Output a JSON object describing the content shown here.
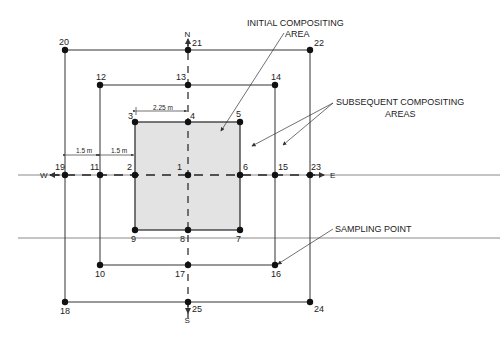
{
  "figure": {
    "colors": {
      "line": "#333333",
      "ground_line": "#888888",
      "initial_area_fill": "#e3e3e3",
      "point": "#111111",
      "text": "#222222"
    }
  },
  "compass": {
    "north": "N",
    "south": "S",
    "east": "E",
    "west": "W"
  },
  "dimensions": {
    "half_width_initial": "2.25 m",
    "spacing_outer": "1.5 m",
    "spacing_inner": "1.5 m"
  },
  "callouts": {
    "initial_line1": "INITIAL COMPOSITING",
    "initial_line2": "AREA",
    "subsequent_line1": "SUBSEQUENT COMPOSITING",
    "subsequent_line2": "AREAS",
    "sampling_point": "SAMPLING POINT"
  },
  "points": [
    {
      "id": "1",
      "x": 188,
      "y": 175
    },
    {
      "id": "2",
      "x": 135,
      "y": 175
    },
    {
      "id": "3",
      "x": 135,
      "y": 122
    },
    {
      "id": "4",
      "x": 188,
      "y": 122
    },
    {
      "id": "5",
      "x": 240,
      "y": 122
    },
    {
      "id": "6",
      "x": 240,
      "y": 175
    },
    {
      "id": "7",
      "x": 240,
      "y": 230
    },
    {
      "id": "8",
      "x": 188,
      "y": 230
    },
    {
      "id": "9",
      "x": 135,
      "y": 230
    },
    {
      "id": "10",
      "x": 100,
      "y": 265
    },
    {
      "id": "11",
      "x": 100,
      "y": 175
    },
    {
      "id": "12",
      "x": 100,
      "y": 85
    },
    {
      "id": "13",
      "x": 188,
      "y": 85
    },
    {
      "id": "14",
      "x": 275,
      "y": 85
    },
    {
      "id": "15",
      "x": 275,
      "y": 175
    },
    {
      "id": "16",
      "x": 275,
      "y": 265
    },
    {
      "id": "17",
      "x": 188,
      "y": 265
    },
    {
      "id": "18",
      "x": 65,
      "y": 302
    },
    {
      "id": "19",
      "x": 65,
      "y": 175
    },
    {
      "id": "20",
      "x": 65,
      "y": 50
    },
    {
      "id": "21",
      "x": 188,
      "y": 50
    },
    {
      "id": "22",
      "x": 310,
      "y": 50
    },
    {
      "id": "23",
      "x": 310,
      "y": 175
    },
    {
      "id": "24",
      "x": 310,
      "y": 302
    },
    {
      "id": "25",
      "x": 188,
      "y": 302
    }
  ]
}
